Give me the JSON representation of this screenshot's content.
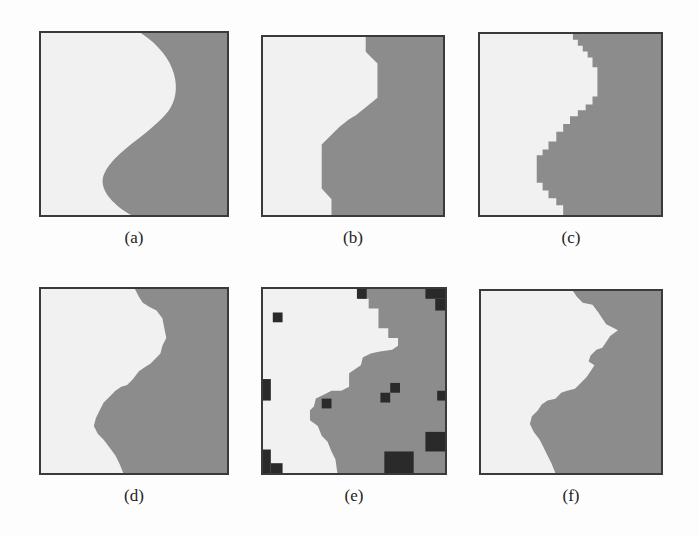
{
  "figure": {
    "colors": {
      "background": "#fdfdfd",
      "light_region": "#f1f1f1",
      "dark_region": "#8c8c8c",
      "noise_blocks": "#2a2a2a",
      "border": "#3a3a3a"
    },
    "panels": [
      {
        "id": "a",
        "label": "(a)",
        "description": "smooth S-shaped boundary"
      },
      {
        "id": "b",
        "label": "(b)",
        "description": "coarse polygonal boundary"
      },
      {
        "id": "c",
        "label": "(c)",
        "description": "stair-stepped pixelated boundary"
      },
      {
        "id": "d",
        "label": "(d)",
        "description": "rough jagged boundary"
      },
      {
        "id": "e",
        "label": "(e)",
        "description": "blocky boundary with dark noise squares"
      },
      {
        "id": "f",
        "label": "(f)",
        "description": "irregular fractal-like boundary"
      }
    ]
  }
}
